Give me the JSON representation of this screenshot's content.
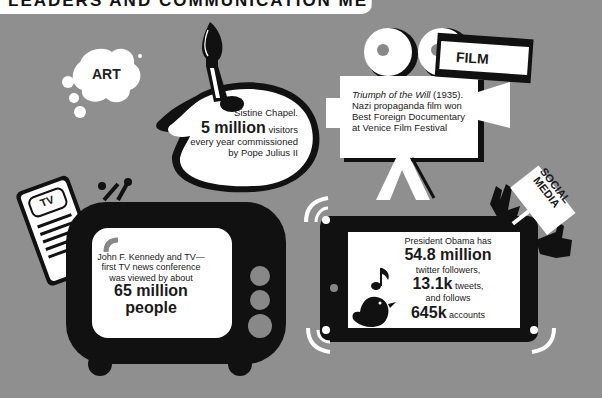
{
  "header": {
    "title": "LEADERS AND COMMUNICATION METHODS"
  },
  "colors": {
    "background": "#8f8f8f",
    "ink": "#111111",
    "paper": "#ffffff"
  },
  "sections": {
    "art": {
      "label": "ART",
      "line1": "Sistine Chapel.",
      "big": "5 million",
      "after_big": " visitors",
      "line3": "every year commissioned",
      "line4": "by Pope Julius II"
    },
    "film": {
      "label": "FILM",
      "title_italic": "Triumph of the Will",
      "year": " (1935).",
      "line2": "Nazi propaganda film won",
      "line3": "Best Foreign Documentary",
      "line4": "at Venice Film Festival"
    },
    "tv": {
      "remote_label": "TV",
      "line1": "John F. Kennedy and TV—",
      "line2": "first TV news conference",
      "line3": "was viewed by about",
      "big1": "65 million",
      "big2": "people"
    },
    "social": {
      "label_line1": "SOCIAL",
      "label_line2": "MEDIA",
      "line1": "President Obama has",
      "big1": "54.8 million",
      "line2": "twitter followers,",
      "big2": "13.1k",
      "after_big2": " tweets,",
      "line3": "and follows",
      "big3": "645k",
      "after_big3": " accounts"
    }
  }
}
